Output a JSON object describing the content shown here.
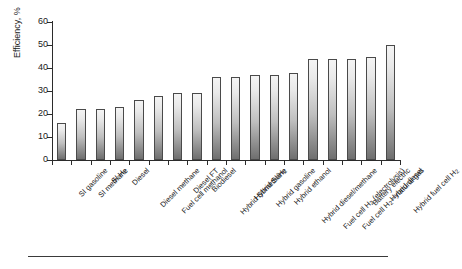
{
  "chart_data": {
    "type": "bar",
    "title": "",
    "xlabel": "",
    "ylabel": "Efficiency, %",
    "ylim": [
      0,
      60
    ],
    "yticks": [
      0,
      10,
      20,
      30,
      40,
      50,
      60
    ],
    "grid": false,
    "legend": null,
    "categories": [
      "SI gasoline",
      "SI methane",
      "SI H2",
      "Diesel",
      "Diesel methane",
      "Fuel cell methanol",
      "Diesel FT",
      "Biodiesel",
      "Hybrid SI/methane",
      "Hybrid SI/H2",
      "Hybrid gasoline",
      "Hybrid ethanol",
      "Hybrid diesel/methane",
      "Fuel cell H2 (electrolysis)",
      "Fuel cell H2—natural gas",
      "Battery electric",
      "Hybrid diesel",
      "Hybrid fuel cell H2"
    ],
    "categories_html": [
      "SI gasoline",
      "SI methane",
      "SI H<sub>2</sub>",
      "Diesel",
      "Diesel methane",
      "Fuel cell methanol",
      "Diesel FT",
      "Biodiesel",
      "Hybrid SI/methane",
      "Hybrid SI/H<sub>2</sub>",
      "Hybrid gasoline",
      "Hybrid ethanol",
      "Hybrid diesel/methane",
      "Fuel cell H<sub>2</sub> (electrolysis)",
      "Fuel cell H<sub>2</sub>—natural gas",
      "Battery electric",
      "Hybrid diesel",
      "Hybrid fuel cell H<sub>2</sub>"
    ],
    "values": [
      16,
      22,
      22,
      23,
      26,
      28,
      29,
      29,
      36,
      36,
      37,
      37,
      38,
      44,
      44,
      44,
      45,
      50
    ],
    "bar_face_color": "#cfcfcf",
    "bar_edge_color": "#4a4a4a",
    "axis_color": "#2b2b2b"
  },
  "ylabel": "Efficiency, %"
}
